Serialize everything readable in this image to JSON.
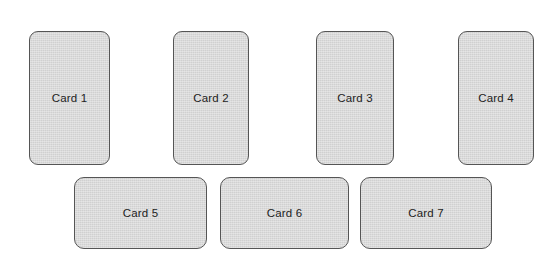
{
  "canvas": {
    "width": 552,
    "height": 274,
    "background_color": "#ffffff"
  },
  "style": {
    "card_fill_color": "#d0d0d0",
    "card_border_color": "#555555",
    "card_text_color": "#222222"
  },
  "rows": [
    {
      "name": "top-row",
      "cards": [
        {
          "label": "Card 1",
          "x": 29,
          "y": 31,
          "w": 81,
          "h": 134
        },
        {
          "label": "Card 2",
          "x": 173,
          "y": 31,
          "w": 76,
          "h": 134
        },
        {
          "label": "Card 3",
          "x": 316,
          "y": 31,
          "w": 78,
          "h": 134
        },
        {
          "label": "Card 4",
          "x": 458,
          "y": 31,
          "w": 76,
          "h": 134
        }
      ]
    },
    {
      "name": "bottom-row",
      "cards": [
        {
          "label": "Card 5",
          "x": 74,
          "y": 177,
          "w": 133,
          "h": 72
        },
        {
          "label": "Card 6",
          "x": 220,
          "y": 177,
          "w": 129,
          "h": 72
        },
        {
          "label": "Card 7",
          "x": 360,
          "y": 177,
          "w": 132,
          "h": 72
        }
      ]
    }
  ]
}
